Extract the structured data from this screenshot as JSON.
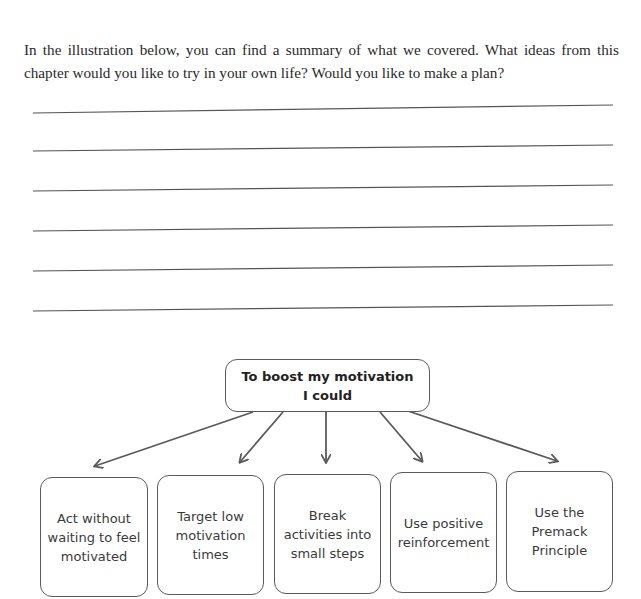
{
  "intro_text": "In the illustration below, you can find a summary of what we covered. What ideas from this chapter would you like to try in your own life? Would you like to make a plan?",
  "writing_lines": {
    "count": 6
  },
  "diagram": {
    "root": {
      "line1": "To boost my motivation",
      "line2": "I could"
    },
    "children": [
      {
        "label": "Act without waiting to feel motivated"
      },
      {
        "label": "Target low motivation times"
      },
      {
        "label": "Break activities into small steps"
      },
      {
        "label": "Use positive reinforcement"
      },
      {
        "label": "Use the Premack Principle"
      }
    ],
    "colors": {
      "stroke": "#5a5a5a",
      "text": "#3a3a3a"
    }
  }
}
